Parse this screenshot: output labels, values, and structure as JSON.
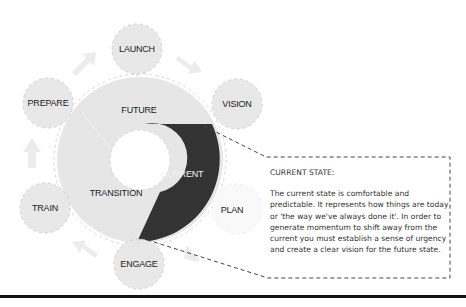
{
  "diagram": {
    "center_ring": {
      "segments": [
        {
          "label": "FUTURE",
          "shade": "#e6e6e6"
        },
        {
          "label": "CURRENT",
          "shade": "#333333"
        },
        {
          "label": "TRANSITION",
          "shade": "#e6e6e6"
        }
      ]
    },
    "satellites": [
      {
        "label": "LAUNCH"
      },
      {
        "label": "VISION"
      },
      {
        "label": "PLAN"
      },
      {
        "label": "ENGAGE"
      },
      {
        "label": "TRAIN"
      },
      {
        "label": "PREPARE"
      }
    ],
    "callout": {
      "title": "CURRENT STATE:",
      "body": "The current state is comfortable and predictable. It represents how things are today or 'the way we've always done it'. In order to generate momentum to shift away from the current you must establish a sense of urgency and create a clear vision for the future state."
    },
    "colors": {
      "circle_fill": "#e8e8e8",
      "dark_segment": "#333333",
      "dash": "#cfcfcf",
      "callout_border": "#444444"
    }
  }
}
